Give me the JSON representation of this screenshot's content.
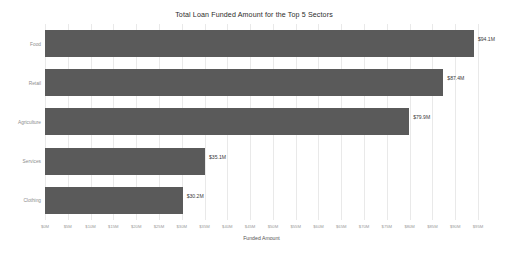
{
  "chart_data": {
    "type": "bar",
    "orientation": "horizontal",
    "title": "Total Loan Funded Amount for the Top 5 Sectors",
    "xlabel": "Funded Amount",
    "ylabel": "",
    "categories": [
      "Food",
      "Retail",
      "Agriculture",
      "Services",
      "Clothing"
    ],
    "values": [
      94.1,
      87.4,
      79.9,
      35.1,
      30.2
    ],
    "value_labels": [
      "$94.1M",
      "$87.4M",
      "$79.9M",
      "$35.1M",
      "$30.2M"
    ],
    "xlim": [
      0,
      95
    ],
    "xtick_labels": [
      "$0M",
      "$5M",
      "$10M",
      "$15M",
      "$20M",
      "$25M",
      "$30M",
      "$35M",
      "$40M",
      "$45M",
      "$50M",
      "$55M",
      "$60M",
      "$65M",
      "$70M",
      "$75M",
      "$80M",
      "$85M",
      "$90M",
      "$95M"
    ],
    "xtick_values": [
      0,
      5,
      10,
      15,
      20,
      25,
      30,
      35,
      40,
      45,
      50,
      55,
      60,
      65,
      70,
      75,
      80,
      85,
      90,
      95
    ],
    "grid": true,
    "legend": false,
    "bar_color": "#5a5a5a",
    "background_color": "#ffffff"
  }
}
